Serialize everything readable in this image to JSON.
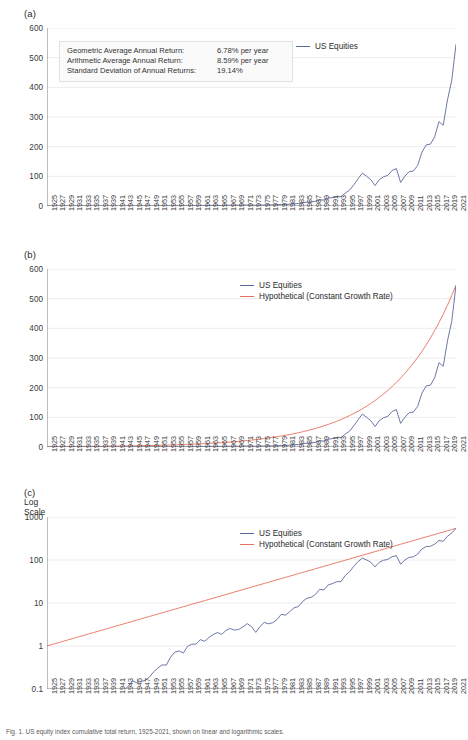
{
  "figure": {
    "caption": "Fig. 1. US equity index cumulative total return, 1925-2021, shown on linear and logarithmic scales."
  },
  "colors": {
    "us_equities": "#5b6a9e",
    "hypothetical": "#e8705a",
    "axis": "#888888",
    "grid": "#ececec",
    "text": "#3a3a3a"
  },
  "panels": [
    {
      "id": "a",
      "label": "(a)",
      "scale_note": "",
      "legend": [
        "US Equities"
      ],
      "yticks": [
        "0",
        "100",
        "200",
        "300",
        "400",
        "500",
        "600"
      ],
      "stats": [
        {
          "key": "Geometric Average Annual Return:",
          "value": "6.78% per year"
        },
        {
          "key": "Arithmetic Average Annual Return:",
          "value": "8.59% per year"
        },
        {
          "key": "Standard Deviation of Annual Returns:",
          "value": "19.14%"
        }
      ]
    },
    {
      "id": "b",
      "label": "(b)",
      "scale_note": "",
      "legend": [
        "US Equities",
        "Hypothetical (Constant Growth Rate)"
      ],
      "yticks": [
        "0",
        "100",
        "200",
        "300",
        "400",
        "500",
        "600"
      ],
      "stats": []
    },
    {
      "id": "c",
      "label": "(c)",
      "scale_note": "Log\nScale",
      "scale_note_line1": "Log",
      "scale_note_line2": "Scale",
      "legend": [
        "US Equities",
        "Hypothetical (Constant Growth Rate)"
      ],
      "yticks": [
        "0.1",
        "1",
        "10",
        "100",
        "1000"
      ],
      "stats": []
    }
  ],
  "chart_data": {
    "type": "line",
    "title": "",
    "xlabel": "",
    "ylabel": "",
    "grid": true,
    "legend_position": "top-right",
    "panels": [
      {
        "id": "a",
        "ylim": [
          0,
          600
        ],
        "yscale": "linear",
        "yticks": [
          0,
          100,
          200,
          300,
          400,
          500,
          600
        ],
        "series": [
          "US Equities"
        ]
      },
      {
        "id": "b",
        "ylim": [
          0,
          600
        ],
        "yscale": "linear",
        "yticks": [
          0,
          100,
          200,
          300,
          400,
          500,
          600
        ],
        "series": [
          "US Equities",
          "Hypothetical (Constant Growth Rate)"
        ]
      },
      {
        "id": "c",
        "ylim": [
          0.1,
          1000
        ],
        "yscale": "log",
        "yticks": [
          0.1,
          1,
          10,
          100,
          1000
        ],
        "series": [
          "US Equities",
          "Hypothetical (Constant Growth Rate)"
        ]
      }
    ],
    "xlim": [
      1925,
      2021
    ],
    "xtick_step": 2,
    "x": [
      1925,
      1926,
      1927,
      1928,
      1929,
      1930,
      1931,
      1932,
      1933,
      1934,
      1935,
      1936,
      1937,
      1938,
      1939,
      1940,
      1941,
      1942,
      1943,
      1944,
      1945,
      1946,
      1947,
      1948,
      1949,
      1950,
      1951,
      1952,
      1953,
      1954,
      1955,
      1956,
      1957,
      1958,
      1959,
      1960,
      1961,
      1962,
      1963,
      1964,
      1965,
      1966,
      1967,
      1968,
      1969,
      1970,
      1971,
      1972,
      1973,
      1974,
      1975,
      1976,
      1977,
      1978,
      1979,
      1980,
      1981,
      1982,
      1983,
      1984,
      1985,
      1986,
      1987,
      1988,
      1989,
      1990,
      1991,
      1992,
      1993,
      1994,
      1995,
      1996,
      1997,
      1998,
      1999,
      2000,
      2001,
      2002,
      2003,
      2004,
      2005,
      2006,
      2007,
      2008,
      2009,
      2010,
      2011,
      2012,
      2013,
      2014,
      2015,
      2016,
      2017,
      2018,
      2019,
      2020,
      2021
    ],
    "xticks": [
      "1925",
      "1927",
      "1929",
      "1931",
      "1933",
      "1935",
      "1937",
      "1939",
      "1941",
      "1943",
      "1945",
      "1947",
      "1949",
      "1951",
      "1953",
      "1955",
      "1957",
      "1959",
      "1961",
      "1963",
      "1965",
      "1967",
      "1969",
      "1971",
      "1973",
      "1975",
      "1977",
      "1979",
      "1981",
      "1983",
      "1985",
      "1987",
      "1989",
      "1991",
      "1993",
      "1995",
      "1997",
      "1999",
      "2001",
      "2003",
      "2005",
      "2007",
      "2009",
      "2011",
      "2013",
      "2015",
      "2017",
      "2019",
      "2021"
    ],
    "series": [
      {
        "name": "US Equities",
        "color": "#5b6a9e",
        "values": [
          1.0,
          1.12,
          1.54,
          2.21,
          2.03,
          1.52,
          0.86,
          0.79,
          1.22,
          1.2,
          1.78,
          2.38,
          1.55,
          2.03,
          2.02,
          1.82,
          1.61,
          1.94,
          2.44,
          2.92,
          3.98,
          3.66,
          3.87,
          4.08,
          4.85,
          6.39,
          7.92,
          9.38,
          9.29,
          14.18,
          18.66,
          19.88,
          17.74,
          25.45,
          28.5,
          28.63,
          36.31,
          33.15,
          40.71,
          47.41,
          53.31,
          47.96,
          59.45,
          66.04,
          60.43,
          62.85,
          71.83,
          85.46,
          72.93,
          53.61,
          73.56,
          91.13,
          84.61,
          90.14,
          106.8,
          141.5,
          134.6,
          163.5,
          200.5,
          213.1,
          280.7,
          332.8,
          350.1,
          408.4,
          537.6,
          520.8,
          679.7,
          731.4,
          804.8,
          815.3,
          1121,
          1379,
          1839,
          2364,
          2860,
          2600,
          2291,
          1785,
          2296,
          2546,
          2670,
          3091,
          3260,
          2053,
          2595,
          2986,
          3048,
          3535,
          4679,
          5318,
          5390,
          6034,
          7350,
          7026,
          9238,
          10940,
          14080
        ],
        "values_indexed_display": [
          1.0,
          1.1,
          1.5,
          2.2,
          2.0,
          1.5,
          0.9,
          0.8,
          1.2,
          1.2,
          1.8,
          2.4,
          1.5,
          2.0,
          2.0,
          1.8,
          1.6,
          1.9,
          2.4,
          2.9,
          4.0,
          3.7,
          3.9,
          4.1,
          4.9,
          6.4,
          7.9,
          9.4,
          9.3,
          14.2,
          18.7,
          19.9,
          17.7,
          25.5,
          28.5,
          28.6,
          36.3,
          33.2,
          40.7,
          47.4,
          53.3,
          48.0,
          59.5,
          66.0,
          60.4,
          62.9,
          71.8,
          85.5,
          72.9,
          53.6,
          73.6,
          91.1,
          84.6,
          90.1,
          106.8,
          141.5,
          134.6,
          163.5,
          200.5,
          213.1,
          280.7,
          332.8,
          350.1,
          408.4,
          537.6,
          520.8,
          679.7,
          731.4,
          804.8,
          815.3,
          1121,
          1379,
          1839,
          2364,
          2860,
          2600,
          2291,
          1785,
          2296,
          2546,
          2670,
          3091,
          3260,
          2053,
          2595,
          2986,
          3048,
          3535,
          4679,
          5318,
          5390,
          6034,
          7350,
          7026,
          9238,
          10940,
          14080
        ]
      },
      {
        "name": "Hypothetical (Constant Growth Rate)",
        "color": "#e8705a",
        "growth_rate_pct": 6.78,
        "description": "Smooth exponential curve compounding at the geometric average annual return from 1 in 1925 to ~545 in 2021."
      }
    ],
    "scaled_series_note": "Panels (a) and (b) plot the cumulative value of $1 invested in 1925, ending near 545 in 2021; values above are the underlying index levels rescaled to the 0-600 axis.",
    "panel_a_b_values": [
      1.0,
      1.1,
      1.5,
      2.2,
      2.0,
      1.5,
      0.9,
      0.8,
      1.2,
      1.2,
      1.8,
      2.4,
      1.5,
      2.0,
      2.0,
      1.8,
      1.6,
      1.9,
      2.4,
      2.9,
      4.0,
      3.7,
      3.9,
      4.1,
      4.9,
      6.4,
      7.9,
      9.4,
      9.3,
      14.2,
      18.7,
      19.9,
      17.7,
      25.5,
      28.5,
      28.6,
      36.3,
      33.2,
      40.7,
      47.4,
      53.3,
      48.0,
      59.5,
      66.0,
      60.4,
      62.9,
      71.8,
      85.5,
      72.9,
      53.6,
      73.6,
      91.1,
      84.6,
      90.1,
      106.8,
      141.5,
      134.6,
      163.5,
      200.5,
      213.1,
      280.7,
      332.8,
      350.1,
      408.4,
      537.6,
      520.8,
      679.7,
      731.4,
      804.8,
      815.3,
      1121,
      1379,
      1839,
      2364,
      2860,
      2600,
      2291,
      1785,
      2296,
      2546,
      2670,
      3091,
      3260,
      2053,
      2595,
      2986,
      3048,
      3535,
      4679,
      5318,
      5390,
      6034,
      7350,
      7026,
      9238,
      10940,
      14080
    ]
  }
}
